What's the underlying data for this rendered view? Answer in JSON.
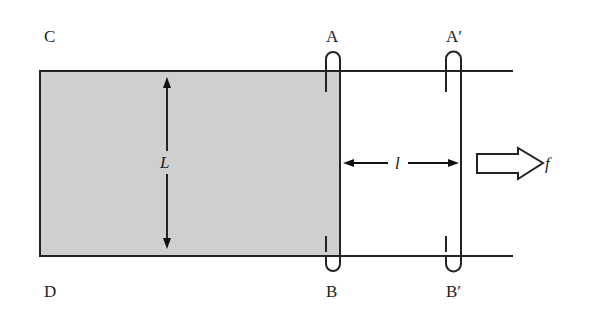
{
  "diagram": {
    "type": "physics-schematic",
    "corner_labels": {
      "top_left": "C",
      "bottom_left": "D"
    },
    "bar_initial": {
      "top_label": "A",
      "bottom_label": "B"
    },
    "bar_displaced": {
      "top_label": "A′",
      "bottom_label": "B′"
    },
    "dimension_labels": {
      "width": "L",
      "displacement": "l"
    },
    "force_label": "f",
    "colors": {
      "shaded_region": "#cfcfcf",
      "line": "#222222",
      "background": "#ffffff"
    }
  }
}
